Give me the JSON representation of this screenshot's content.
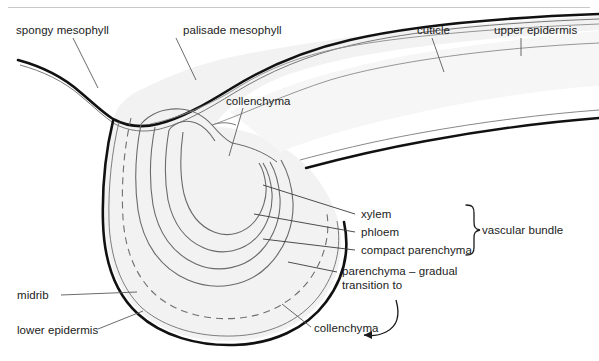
{
  "figure": {
    "top_rule_color": "#c9c9c9",
    "background": "#ffffff",
    "tissue_fill": "#f2f2f2",
    "cuticle_color": "#1a1a1a",
    "outline_color": "#555555",
    "label_color": "#1b1b1b"
  },
  "labels": {
    "spongy_mesophyll": "spongy mesophyll",
    "palisade_mesophyll": "palisade mesophyll",
    "cuticle": "cuticle",
    "upper_epidermis": "upper epidermis",
    "collenchyma_top": "collenchyma",
    "xylem": "xylem",
    "phloem": "phloem",
    "compact_parenchyma": "compact parenchyma",
    "vascular_bundle": "vascular bundle",
    "parenchyma_transition_line1": "parenchyma – gradual",
    "parenchyma_transition_line2": "transition to",
    "midrib": "midrib",
    "lower_epidermis": "lower epidermis",
    "collenchyma_bottom": "collenchyma"
  },
  "annotations": {
    "brace_target": "vascular bundle",
    "brace_members": [
      "xylem",
      "phloem",
      "compact parenchyma"
    ],
    "arrow_from": "parenchyma – gradual transition to",
    "arrow_to": "collenchyma"
  }
}
